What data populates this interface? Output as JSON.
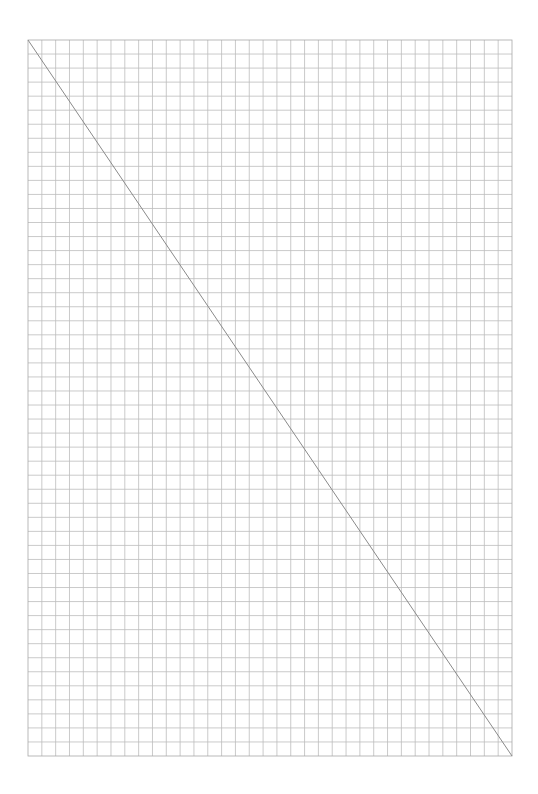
{
  "page": {
    "background": "#ffffff"
  },
  "grid": {
    "left": 28,
    "top": 40,
    "right": 512,
    "bottom": 756,
    "columns": 35,
    "rows": 51,
    "line_color": "#bdbdbd",
    "border_color": "#a8a8a8"
  },
  "diagonal": {
    "x1": 28,
    "y1": 40,
    "x2": 512,
    "y2": 756,
    "color": "#8a8a8a"
  }
}
